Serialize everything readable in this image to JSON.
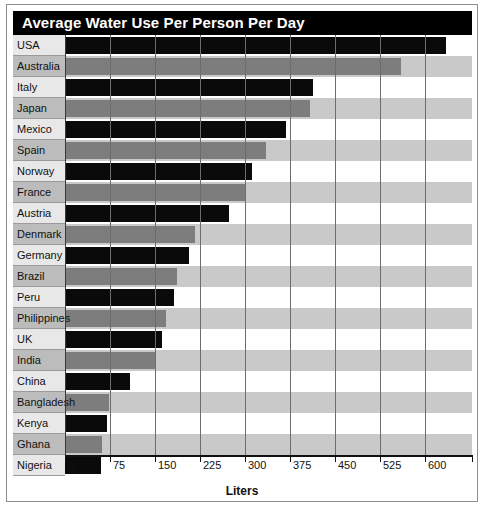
{
  "chart_data": {
    "type": "bar",
    "orientation": "horizontal",
    "title": "Average Water Use Per Person Per Day",
    "xlabel": "Liters",
    "ylabel": "",
    "xlim": [
      0,
      678
    ],
    "xticks": [
      0,
      75,
      150,
      225,
      300,
      375,
      450,
      525,
      600
    ],
    "xtick_labels": [
      "0",
      "75",
      "150",
      "225",
      "300",
      "375",
      "450",
      "525",
      "600"
    ],
    "grid": true,
    "legend": "none",
    "categories": [
      "USA",
      "Australia",
      "Italy",
      "Japan",
      "Mexico",
      "Spain",
      "Norway",
      "France",
      "Austria",
      "Denmark",
      "Germany",
      "Brazil",
      "Peru",
      "Philippines",
      "UK",
      "India",
      "China",
      "Bangladesh",
      "Kenya",
      "Ghana",
      "Nigeria"
    ],
    "values": [
      634,
      560,
      413,
      408,
      368,
      335,
      312,
      302,
      273,
      216,
      206,
      187,
      182,
      169,
      162,
      152,
      108,
      73,
      70,
      62,
      60
    ],
    "bar_colors": [
      "#0a0a0a",
      "#7d7d7d",
      "#0a0a0a",
      "#7d7d7d",
      "#0a0a0a",
      "#7d7d7d",
      "#0a0a0a",
      "#7d7d7d",
      "#0a0a0a",
      "#7d7d7d",
      "#0a0a0a",
      "#7d7d7d",
      "#0a0a0a",
      "#7d7d7d",
      "#0a0a0a",
      "#7d7d7d",
      "#0a0a0a",
      "#7d7d7d",
      "#0a0a0a",
      "#7d7d7d",
      "#0a0a0a"
    ]
  },
  "style": {
    "title_background": "#000000",
    "title_color": "#ffffff",
    "band_odd": "#ffffff",
    "band_even": "#c9c9c9",
    "label_band_odd": "#e8e8e8",
    "label_band_even": "#bcbcbc",
    "gridline_color": "#6d6d6d",
    "axis_color": "#111111",
    "bar_dark": "#0a0a0a",
    "bar_light": "#7d7d7d"
  }
}
